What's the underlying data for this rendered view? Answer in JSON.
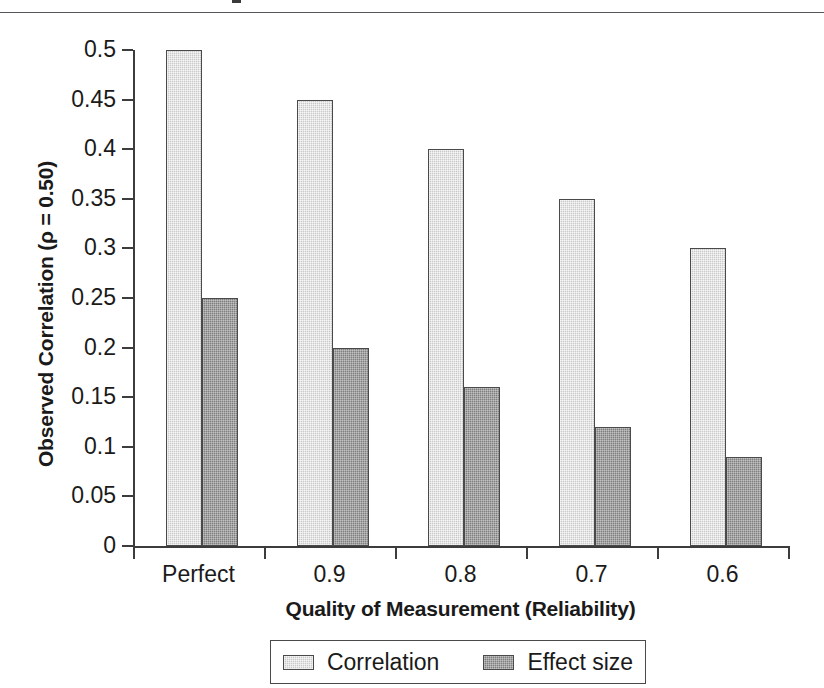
{
  "page": {
    "rule_present": true
  },
  "chart_data": {
    "type": "bar",
    "title": "",
    "xlabel": "Quality of Measurement (Reliability)",
    "ylabel": "Observed Correlation (ρ = 0.50)",
    "categories": [
      "Perfect",
      "0.9",
      "0.8",
      "0.7",
      "0.6"
    ],
    "series": [
      {
        "name": "Correlation",
        "values": [
          0.5,
          0.45,
          0.4,
          0.35,
          0.3
        ],
        "color": "#c9c9c9"
      },
      {
        "name": "Effect size",
        "values": [
          0.25,
          0.2,
          0.16,
          0.12,
          0.09
        ],
        "color": "#7e7e7e"
      }
    ],
    "ylim": [
      0,
      0.5
    ],
    "ytick_labels": [
      "0.5",
      "0.45",
      "0.4",
      "0.35",
      "0.3",
      "0.25",
      "0.2",
      "0.15",
      "0.1",
      "0.05",
      "0"
    ],
    "ytick_values": [
      0.5,
      0.45,
      0.4,
      0.35,
      0.3,
      0.25,
      0.2,
      0.15,
      0.1,
      0.05,
      0
    ],
    "grid": false,
    "legend_position": "bottom",
    "legend_entries": [
      "Correlation",
      "Effect size"
    ]
  }
}
